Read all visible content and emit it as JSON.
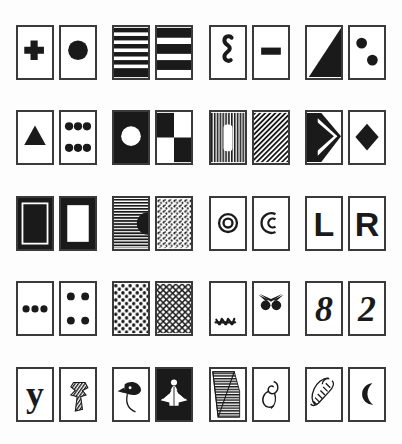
{
  "sheet": {
    "title": "Abstract pattern card pairs",
    "description": "A 5 by 4 grid of paired black-and-white abstract pattern cards",
    "background_color": "#fdfdfd",
    "ink_color": "#1a1a1a",
    "border_color": "#3a3a3a",
    "rows": 5,
    "pairs_per_row": 4,
    "card_count": 40,
    "card_width_px": 38,
    "card_height_px": 55
  },
  "rows": [
    {
      "index": 1,
      "pairs": [
        {
          "index": 1,
          "name": "cross-and-disc",
          "cards": [
            {
              "name": "plus-cross-card",
              "motif": "filled plus cross",
              "fill": "light",
              "label": "cross"
            },
            {
              "name": "filled-circle-card",
              "motif": "large solid circle",
              "fill": "light",
              "label": "disc"
            }
          ]
        },
        {
          "index": 2,
          "name": "horizontal-band-pairs",
          "cards": [
            {
              "name": "thin-horizontal-bands-card",
              "motif": "five thin horizontal bars",
              "fill": "banded",
              "label": "thin bands"
            },
            {
              "name": "thick-horizontal-bands-card",
              "motif": "three thick horizontal bars",
              "fill": "banded",
              "label": "thick bands"
            }
          ]
        },
        {
          "index": 3,
          "name": "squiggle-and-bar",
          "cards": [
            {
              "name": "s-squiggle-card",
              "motif": "vertical S squiggle",
              "fill": "light",
              "label": "squiggle"
            },
            {
              "name": "horizontal-bar-card",
              "motif": "single short horizontal bar",
              "fill": "light",
              "label": "minus bar"
            }
          ]
        },
        {
          "index": 4,
          "name": "triangle-and-two-dots",
          "cards": [
            {
              "name": "diagonal-triangle-card",
              "motif": "solid right triangle filling lower-right",
              "fill": "half",
              "label": "diagonal"
            },
            {
              "name": "two-dots-card",
              "motif": "two solid circles diagonally placed",
              "fill": "light",
              "label": "two dots"
            }
          ]
        }
      ]
    },
    {
      "index": 2,
      "pairs": [
        {
          "index": 1,
          "name": "triangle-and-six-dots",
          "cards": [
            {
              "name": "solid-triangle-card",
              "motif": "solid upward triangle",
              "fill": "light",
              "label": "triangle"
            },
            {
              "name": "six-dots-card",
              "motif": "two rows of three dots",
              "fill": "light",
              "label": "six dots"
            }
          ]
        },
        {
          "index": 2,
          "name": "inverted-disc-and-checker",
          "cards": [
            {
              "name": "white-disc-on-black-card",
              "motif": "white circle on black field",
              "fill": "dark",
              "label": "reverse disc"
            },
            {
              "name": "checkerboard-quadrants-card",
              "motif": "four alternating black and white quadrants",
              "fill": "checker",
              "label": "checker"
            }
          ]
        },
        {
          "index": 3,
          "name": "vertical-stripes-and-hatch",
          "cards": [
            {
              "name": "vertical-stripes-window-card",
              "motif": "vertical stripes with white rounded window",
              "fill": "striped",
              "label": "stripes"
            },
            {
              "name": "diagonal-hatch-card",
              "motif": "diagonal hatching",
              "fill": "hatched",
              "label": "hatch"
            }
          ]
        },
        {
          "index": 4,
          "name": "arrow-and-diamond",
          "cards": [
            {
              "name": "chevron-arrow-card",
              "motif": "black chevron arrow with dot on white and black split",
              "fill": "half",
              "label": "arrow"
            },
            {
              "name": "solid-diamond-card",
              "motif": "solid diamond",
              "fill": "light",
              "label": "diamond"
            }
          ]
        }
      ]
    },
    {
      "index": 3,
      "pairs": [
        {
          "index": 1,
          "name": "frames",
          "cards": [
            {
              "name": "black-frame-filled-card",
              "motif": "black border with black inner block",
              "fill": "dark",
              "label": "filled frame"
            },
            {
              "name": "black-frame-hollow-card",
              "motif": "thick black border with white centre",
              "fill": "dark",
              "label": "hollow frame"
            }
          ]
        },
        {
          "index": 2,
          "name": "stripes-and-speckle",
          "cards": [
            {
              "name": "horizontal-lines-halfdisc-card",
              "motif": "horizontal lines with black half disc at right edge",
              "fill": "lined",
              "label": "lines"
            },
            {
              "name": "speckle-texture-card",
              "motif": "dense random speckle texture",
              "fill": "speckled",
              "label": "speckle"
            }
          ]
        },
        {
          "index": 3,
          "name": "ring-and-crescent",
          "cards": [
            {
              "name": "concentric-ring-card",
              "motif": "concentric circle ring",
              "fill": "light",
              "label": "ring"
            },
            {
              "name": "crescent-outline-card",
              "motif": "open crescent outline",
              "fill": "light",
              "label": "crescent"
            }
          ]
        },
        {
          "index": 4,
          "name": "letters-l-and-r",
          "cards": [
            {
              "name": "letter-l-card",
              "motif": "bold letter L",
              "fill": "light",
              "label": "L"
            },
            {
              "name": "letter-r-card",
              "motif": "bold letter R",
              "fill": "light",
              "label": "R"
            }
          ]
        }
      ]
    },
    {
      "index": 4,
      "pairs": [
        {
          "index": 1,
          "name": "three-dots-and-four-dots",
          "cards": [
            {
              "name": "three-dots-row-card",
              "motif": "three dots in a horizontal row",
              "fill": "light",
              "label": "three dots"
            },
            {
              "name": "four-corner-dots-card",
              "motif": "four dots at the corners",
              "fill": "light",
              "label": "four dots"
            }
          ]
        },
        {
          "index": 2,
          "name": "polka-and-lattice",
          "cards": [
            {
              "name": "polka-dot-card",
              "motif": "regular polka dot array",
              "fill": "dotted",
              "label": "polka dots"
            },
            {
              "name": "lattice-mesh-card",
              "motif": "crossed diagonal lattice mesh",
              "fill": "lattice",
              "label": "lattice"
            }
          ]
        },
        {
          "index": 3,
          "name": "lashes-and-eyes",
          "cards": [
            {
              "name": "lashes-card",
              "motif": "row of small lash strokes at lower left",
              "fill": "light",
              "label": "lashes"
            },
            {
              "name": "eyes-with-brows-card",
              "motif": "two filled eyes under angled brows",
              "fill": "light",
              "label": "eyes"
            }
          ]
        },
        {
          "index": 4,
          "name": "numerals-eight-and-two",
          "cards": [
            {
              "name": "numeral-eight-card",
              "motif": "stylised numeral 8",
              "fill": "light",
              "label": "8"
            },
            {
              "name": "numeral-two-card",
              "motif": "stylised numeral 2",
              "fill": "light",
              "label": "2"
            }
          ]
        }
      ]
    },
    {
      "index": 5,
      "pairs": [
        {
          "index": 1,
          "name": "letter-y-and-striped-glyph",
          "cards": [
            {
              "name": "letter-y-card",
              "motif": "stylised lowercase y",
              "fill": "light",
              "label": "y"
            },
            {
              "name": "striped-cross-glyph-card",
              "motif": "striped crossed glyph",
              "fill": "striped",
              "label": "glyph"
            }
          ]
        },
        {
          "index": 2,
          "name": "bird-and-moth",
          "cards": [
            {
              "name": "bird-head-card",
              "motif": "black bird head with trailing curve",
              "fill": "light",
              "label": "bird"
            },
            {
              "name": "white-moth-on-black-card",
              "motif": "white moth silhouette on black",
              "fill": "dark",
              "label": "moth"
            }
          ]
        },
        {
          "index": 3,
          "name": "wedge-and-sprout",
          "cards": [
            {
              "name": "striped-wedge-card",
              "motif": "striped triangular wedge",
              "fill": "lined",
              "label": "wedge"
            },
            {
              "name": "sprout-outline-card",
              "motif": "twisted leaf sprout outline",
              "fill": "light",
              "label": "sprout"
            }
          ]
        },
        {
          "index": 4,
          "name": "shell-and-moon",
          "cards": [
            {
              "name": "spiral-shell-card",
              "motif": "coiled spiral shell outline",
              "fill": "light",
              "label": "shell"
            },
            {
              "name": "crescent-moon-card",
              "motif": "solid crescent moon",
              "fill": "light",
              "label": "moon"
            }
          ]
        }
      ]
    }
  ]
}
